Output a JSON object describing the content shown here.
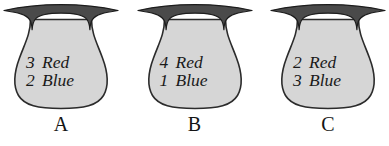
{
  "figure": {
    "name": "three-urns-probability-diagram",
    "background_color": "#ffffff",
    "urn_fill_color": "#d6d6d6",
    "urn_outline_color": "#2b2b2b",
    "text_color": "#1a1a1a"
  },
  "urns": [
    {
      "label": "A",
      "lines": [
        {
          "count": "3",
          "color": "Red"
        },
        {
          "count": "2",
          "color": "Blue"
        }
      ]
    },
    {
      "label": "B",
      "lines": [
        {
          "count": "4",
          "color": "Red"
        },
        {
          "count": "1",
          "color": "Blue"
        }
      ]
    },
    {
      "label": "C",
      "lines": [
        {
          "count": "2",
          "color": "Red"
        },
        {
          "count": "3",
          "color": "Blue"
        }
      ]
    }
  ]
}
